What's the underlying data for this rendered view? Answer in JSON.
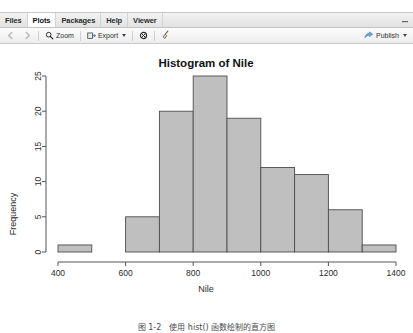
{
  "window": {
    "tabs": [
      {
        "id": "files",
        "label": "Files",
        "active": false
      },
      {
        "id": "plots",
        "label": "Plots",
        "active": true
      },
      {
        "id": "packages",
        "label": "Packages",
        "active": false
      },
      {
        "id": "help",
        "label": "Help",
        "active": false
      },
      {
        "id": "viewer",
        "label": "Viewer",
        "active": false
      }
    ],
    "minimize_glyph": "▬"
  },
  "toolbar": {
    "back_icon": "left-arrow-icon",
    "forward_icon": "right-arrow-icon",
    "zoom_label": "Zoom",
    "zoom_icon": "magnifier-icon",
    "export_label": "Export",
    "export_icon": "export-icon",
    "export_caret": "▾",
    "remove_icon": "remove-plot-icon",
    "clear_icon": "broom-icon",
    "publish_label": "Publish",
    "publish_icon": "publish-icon",
    "publish_caret": "▾"
  },
  "chart_data": {
    "type": "bar",
    "title": "Histogram of Nile",
    "xlabel": "Nile",
    "ylabel": "Frequency",
    "categories": [
      "400-500",
      "500-600",
      "600-700",
      "700-800",
      "800-900",
      "900-1000",
      "1000-1100",
      "1100-1200",
      "1200-1300",
      "1300-1400"
    ],
    "bin_edges": [
      400,
      500,
      600,
      700,
      800,
      900,
      1000,
      1100,
      1200,
      1300,
      1400
    ],
    "values": [
      1,
      0,
      5,
      20,
      25,
      19,
      12,
      11,
      6,
      1
    ],
    "xlim": [
      400,
      1400
    ],
    "ylim": [
      0,
      25
    ],
    "xticks": [
      400,
      600,
      800,
      1000,
      1200,
      1400
    ],
    "yticks": [
      0,
      5,
      10,
      15,
      20,
      25
    ],
    "grid": false,
    "legend": null,
    "bar_fill": "#bfbfbf",
    "bar_stroke": "#4d4d4d",
    "axis_color": "#555555"
  },
  "caption": {
    "text": "图 1‐2　使用 hist() 函数绘制的直方图"
  }
}
